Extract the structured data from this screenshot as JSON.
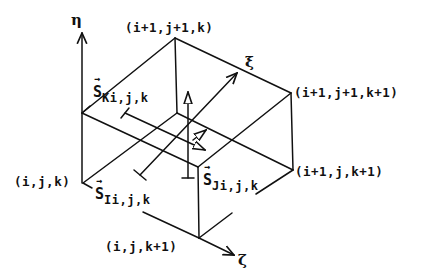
{
  "diagram": {
    "stroke_color": "#111111",
    "background": "#ffffff",
    "axes": {
      "eta": {
        "label": "η",
        "direction": "up"
      },
      "xi": {
        "label": "ξ",
        "direction": "up-right"
      },
      "zeta": {
        "label": "ζ",
        "direction": "down-right"
      }
    },
    "vertices": {
      "v_ijk": "(i,j,k)",
      "v_i1j1k": "(i+1,j+1,k)",
      "v_i1j1k1": "(i+1,j+1,k+1)",
      "v_i1jk1": "(i+1,j,k+1)",
      "v_ijk1": "(i,j,k+1)"
    },
    "face_vectors": {
      "SK": {
        "symbol": "S",
        "subscript": "Ki,j,k"
      },
      "SI": {
        "symbol": "S",
        "subscript": "Ii,j,k"
      },
      "SJ": {
        "symbol": "S",
        "subscript": "Ji,j,k"
      }
    }
  }
}
